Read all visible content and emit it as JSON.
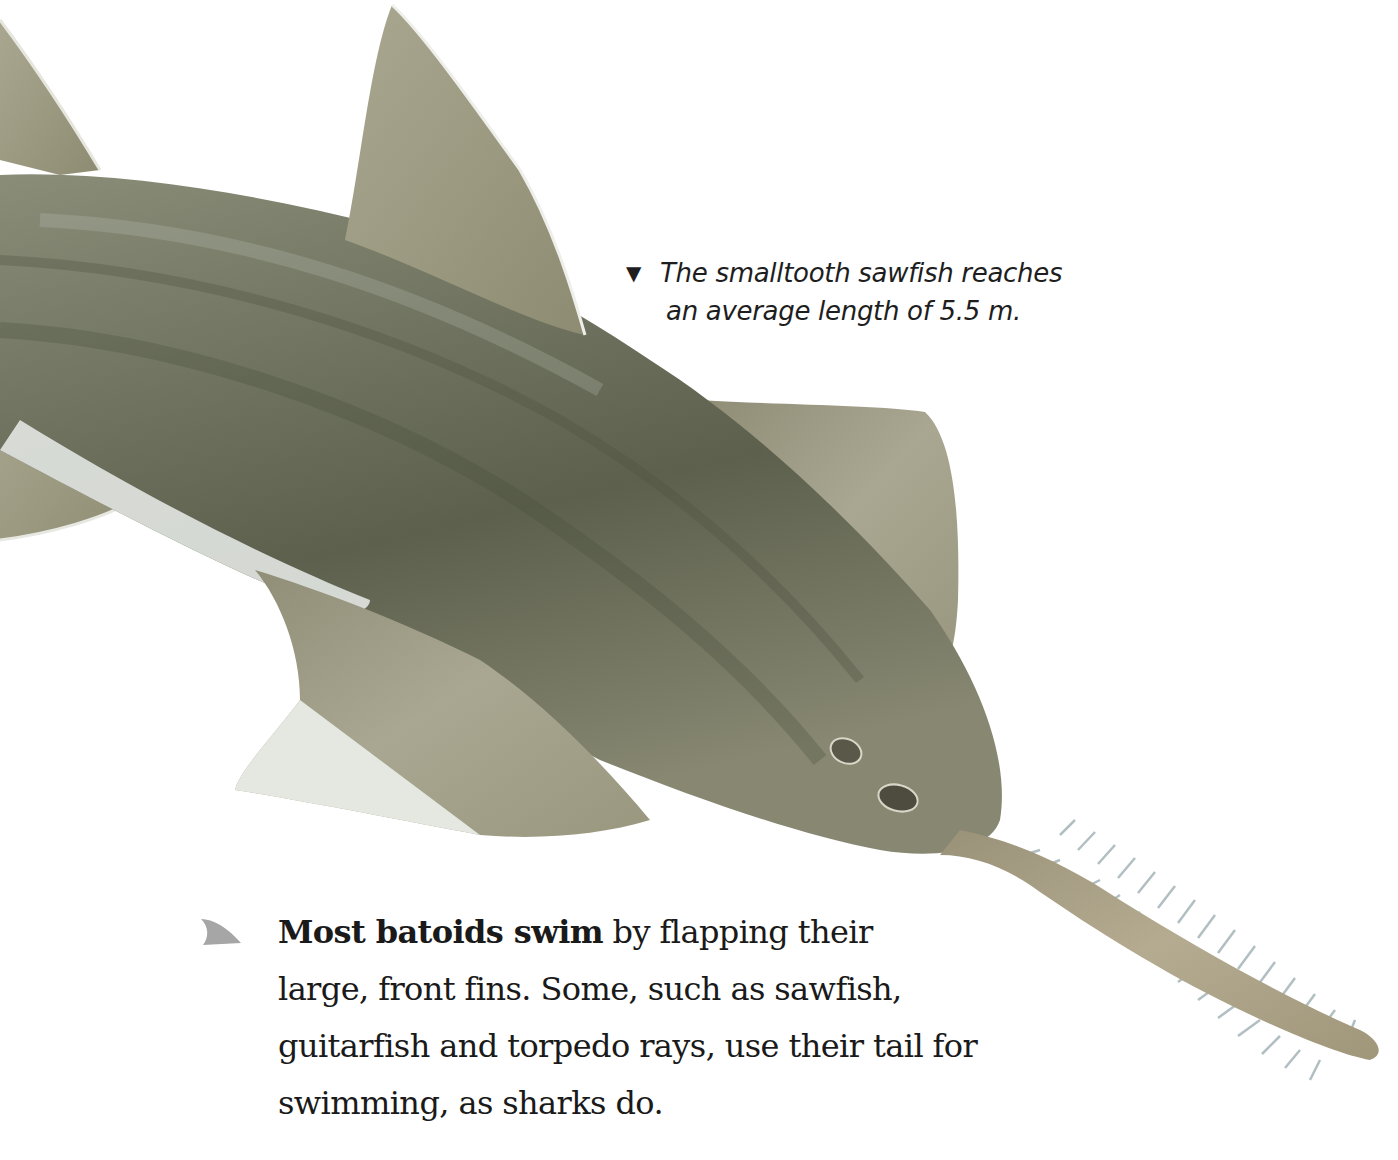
{
  "illustration": {
    "subject": "smalltooth sawfish",
    "colors": {
      "body_dark": "#5a5f4c",
      "body_mid": "#7d806c",
      "body_light": "#a7a892",
      "fin": "#9c9a84",
      "fin_light": "#c3c1ad",
      "belly": "#e4e7e2",
      "teeth": "#a9b8bc",
      "rostrum": "#a89f85"
    }
  },
  "caption": {
    "marker": "▼",
    "line1": "The smalltooth sawfish reaches",
    "line2": "an average length of 5.5 m."
  },
  "paragraph": {
    "bullet_icon": "shark-fin-icon",
    "bullet_color": "#a6a6a6",
    "lead": "Most batoids swim",
    "line1_rest": " by flapping their",
    "line2": "large, front fins. Some, such as sawfish,",
    "line3": "guitarfish and torpedo rays, use their tail for",
    "line4": "swimming, as sharks do."
  }
}
